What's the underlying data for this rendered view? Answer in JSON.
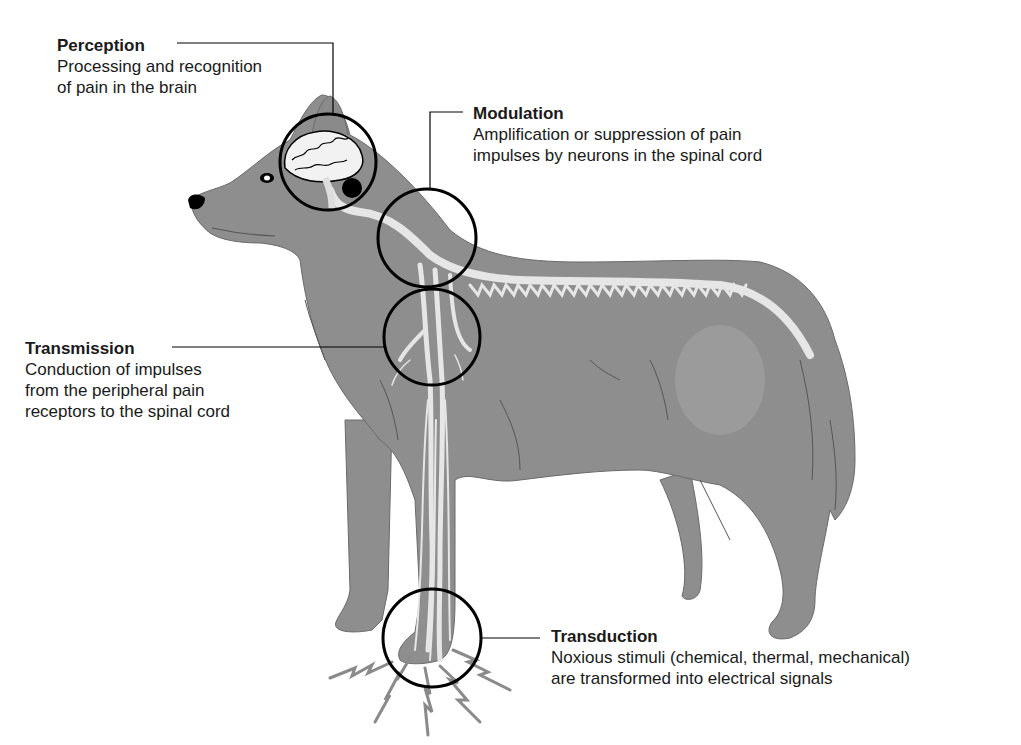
{
  "diagram": {
    "colors": {
      "body": "#8e8e8e",
      "nerve": "#e6e6e6",
      "outline": "#000000",
      "text": "#1a1a1a",
      "fur_stroke": "#555555",
      "stimulus": "#8a8a8a"
    },
    "callouts": [
      {
        "id": "perception",
        "title": "Perception",
        "description_lines": [
          "Processing and recognition",
          "of pain in the brain"
        ],
        "location": "brain"
      },
      {
        "id": "modulation",
        "title": "Modulation",
        "description_lines": [
          "Amplification or suppression of pain",
          "impulses by neurons in the spinal cord"
        ],
        "location": "spinal cord at neck"
      },
      {
        "id": "transmission",
        "title": "Transmission",
        "description_lines": [
          "Conduction of impulses",
          "from the peripheral pain",
          "receptors to the spinal cord"
        ],
        "location": "brachial nerves at shoulder"
      },
      {
        "id": "transduction",
        "title": "Transduction",
        "description_lines": [
          "Noxious stimuli (chemical, thermal, mechanical)",
          "are transformed into electrical signals"
        ],
        "location": "front paw"
      }
    ]
  }
}
